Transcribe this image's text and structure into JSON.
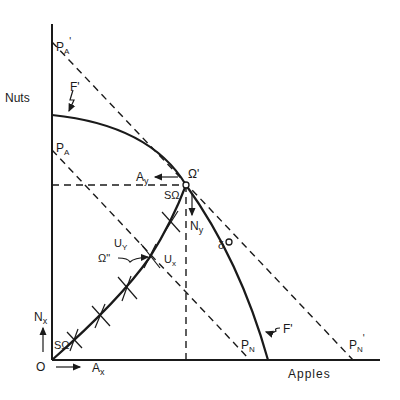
{
  "diagram": {
    "axes": {
      "y_label": "Nuts",
      "x_label": "Apples",
      "origin_label": "O"
    },
    "curves": {
      "frontier_label": "F'",
      "frontier_label_bottom": "F'"
    },
    "price_lines": {
      "pa_prime": "P",
      "pa_prime_sub": "A",
      "pa_prime_sup": "'",
      "pa": "P",
      "pa_sub": "A",
      "pn": "P",
      "pn_sub": "N",
      "pn_prime": "P",
      "pn_prime_sub": "N",
      "pn_prime_sup": "'"
    },
    "points": {
      "omega_prime": "Ω'",
      "omega_double_prime": "Ω\"",
      "delta": "δ",
      "s_omega_top": "SΩ",
      "s_omega_bottom": "SΩ"
    },
    "arrows": {
      "ay": "A",
      "ay_sub": "y",
      "ny": "N",
      "ny_sub": "y",
      "nx": "N",
      "nx_sub": "x",
      "ax": "A",
      "ax_sub": "x"
    },
    "indifference": {
      "uy": "U",
      "uy_sub": "Y",
      "ux": "U",
      "ux_sub": "x"
    },
    "colors": {
      "ink": "#1a1a1a",
      "background": "#ffffff"
    }
  }
}
